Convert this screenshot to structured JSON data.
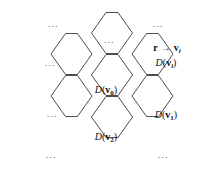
{
  "figure": {
    "background_color": "#ffffff",
    "stroke_color": "#3a3a3a",
    "text_color": "#111111",
    "width": 204,
    "height": 175,
    "hex_orientation": "flat-top"
  },
  "cells": [
    {
      "id": "cell-top-center",
      "cx": 112,
      "cy": 33,
      "label": "",
      "ellipsis": "∙∙∙"
    },
    {
      "id": "cell-top-right",
      "cx": 152.5,
      "cy": 54,
      "label": "D(v_i)",
      "ellipsis": ""
    },
    {
      "id": "cell-left-upper",
      "cx": 71.5,
      "cy": 54,
      "label": "",
      "ellipsis": "∙∙∙"
    },
    {
      "id": "cell-center",
      "cx": 112,
      "cy": 75,
      "label": "D(v_0)",
      "ellipsis": ""
    },
    {
      "id": "cell-left-lower",
      "cx": 71.5,
      "cy": 96,
      "label": "",
      "ellipsis": "∙∙∙"
    },
    {
      "id": "cell-right-lower",
      "cx": 152.5,
      "cy": 96,
      "label": "D(v_1)",
      "ellipsis": ""
    },
    {
      "id": "cell-bottom",
      "cx": 112,
      "cy": 117,
      "label": "D(v_2)",
      "ellipsis": ""
    }
  ],
  "labels": {
    "mapping": {
      "r": "r",
      "arrow": "→",
      "v": "v",
      "subscript": "i"
    },
    "d_vi": {
      "fn": "D",
      "open": "(",
      "v": "v",
      "sub": "i",
      "close": ")"
    },
    "d_v0": {
      "fn": "D",
      "open": "(",
      "v": "v",
      "sub": "0",
      "close": ")"
    },
    "d_v1": {
      "fn": "D",
      "open": "(",
      "v": "v",
      "sub": "1",
      "close": ")"
    },
    "d_v2": {
      "fn": "D",
      "open": "(",
      "v": "v",
      "sub": "2",
      "close": ")"
    }
  },
  "ellipses": [
    {
      "name": "ellipsis-top-left",
      "x": 53,
      "y": 27,
      "text": "···"
    },
    {
      "name": "ellipsis-top-center",
      "x": 109,
      "y": 43,
      "text": "···"
    },
    {
      "name": "ellipsis-top-right",
      "x": 158,
      "y": 27,
      "text": "···"
    },
    {
      "name": "ellipsis-left-upper",
      "x": 50,
      "y": 66,
      "text": "···"
    },
    {
      "name": "ellipsis-left-lower",
      "x": 52,
      "y": 117,
      "text": "···"
    },
    {
      "name": "ellipsis-bottom-left",
      "x": 51,
      "y": 158,
      "text": "···"
    },
    {
      "name": "ellipsis-bottom-right",
      "x": 163,
      "y": 158,
      "text": "···"
    }
  ],
  "geometry": {
    "hex_half_width": 20.5,
    "hex_corner_run": 14.5,
    "hex_half_height": 20.5,
    "note": "flat-top hexagons, columns alternate vertical offset"
  }
}
